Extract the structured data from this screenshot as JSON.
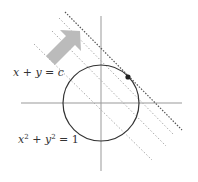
{
  "diagram": {
    "labels": {
      "line_equation": "x + y = c",
      "circle_equation_lhs_x": "x",
      "circle_equation_lhs_y": "y",
      "circle_equation_exp": "2",
      "circle_equation_rest": "= 1",
      "circle_equation_plus": "+"
    },
    "colors": {
      "axis": "#999999",
      "circle": "#333333",
      "tangent_line": "#555555",
      "level_lines": "#aaaaaa",
      "arrow": "#bbbbbb",
      "tangent_point": "#222222"
    },
    "elements": {
      "axes": {
        "origin": [
          101,
          103
        ],
        "x_range": [
          21,
          182
        ],
        "y_range": [
          16,
          171
        ]
      },
      "circle": {
        "cx": 101,
        "cy": 103,
        "r": 38
      },
      "level_lines": [
        {
          "x1": 34,
          "y1": 44,
          "x2": 152,
          "y2": 160,
          "style": "dotted-light"
        },
        {
          "x1": 52,
          "y1": 31,
          "x2": 166,
          "y2": 146,
          "style": "dotted-light"
        },
        {
          "x1": 59,
          "y1": 18,
          "x2": 174,
          "y2": 135,
          "style": "dotted-light"
        },
        {
          "x1": 65,
          "y1": 12,
          "x2": 182,
          "y2": 130,
          "style": "dotted-dark"
        }
      ],
      "tangent_point": {
        "x": 128,
        "y": 77
      },
      "arrow": {
        "from": [
          52,
          62
        ],
        "to": [
          80,
          32
        ],
        "meaning": "direction of increasing c"
      }
    }
  }
}
